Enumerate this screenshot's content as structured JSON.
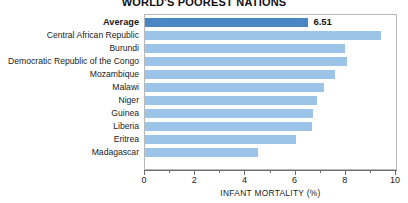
{
  "chart_data": {
    "type": "bar",
    "orientation": "horizontal",
    "title": "WORLD'S POOREST NATIONS",
    "xlabel": "INFANT MORTALITY (%)",
    "ylabel": "",
    "xlim": [
      0,
      10
    ],
    "xticks": [
      0,
      2,
      4,
      6,
      8,
      10
    ],
    "xtick_labels": [
      "0",
      "2",
      "4",
      "6",
      "8",
      "10"
    ],
    "minor_xticks": [
      1,
      3,
      5,
      7,
      9
    ],
    "grid": false,
    "legend": false,
    "categories": [
      "Average",
      "Central African Republic",
      "Burundi",
      "Democratic Republic of the Congo",
      "Mozambique",
      "Malawi",
      "Niger",
      "Guinea",
      "Liberia",
      "Eritrea",
      "Madagascar"
    ],
    "values": [
      6.51,
      9.4,
      7.97,
      8.05,
      7.55,
      7.15,
      6.85,
      6.7,
      6.65,
      6.0,
      4.5
    ],
    "data_labels": {
      "Average": "6.51"
    },
    "highlight_category": "Average",
    "colors": {
      "bar": "#9cc3e8",
      "bar_highlight": "#4a86c4",
      "axis": "#6e6e6e",
      "frame": "#b8b8b8",
      "text": "#1b1b1b"
    }
  }
}
